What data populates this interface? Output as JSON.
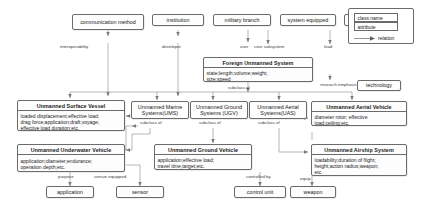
{
  "diagram": {
    "legend": {
      "class_name": "class name",
      "attribute": "attribute",
      "relation": "relation",
      "arrow_icon": "arrow-right-icon"
    },
    "nodes": {
      "communication_method": {
        "label": "communication method"
      },
      "institution": {
        "label": "institution"
      },
      "military_branch": {
        "label": "military branch"
      },
      "system_equipped": {
        "label": "system equipped"
      },
      "system_component": {
        "label": "system component"
      },
      "technology": {
        "label": "technology"
      },
      "foreign_unmanned_system": {
        "name": "Foreign Unmanned System",
        "attributes": "state;length;volume;weight;\nsize;speed"
      },
      "unmanned_surface_vessel": {
        "name": "Unmanned Surface Vessel",
        "attributes": "loaded displacement;effective load;\ndrag force;application;draft;voyage;\neffective load duration;etc."
      },
      "unmanned_marine_systems": {
        "label": "Unmanned Marine\nSystems(UMS)"
      },
      "unmanned_ground_systems": {
        "label": "Unmanned Ground\nSystems  (UGV)"
      },
      "unmanned_aerial_systems": {
        "label": "Unmanned Aerial\nSystems(UAS)"
      },
      "unmanned_aerial_vehicle": {
        "name": "Unmanned Aerial Vehicle",
        "attributes": "diameter rotor;   effective\nload;ceiling;etc."
      },
      "unmanned_underwater_vehicle": {
        "name": "Unmanned Underwater Vehicle",
        "attributes": "application;diameter;endurance;\noperation depth;etc."
      },
      "unmanned_ground_vehicle": {
        "name": "Unmanned Ground Vehicle",
        "attributes": "application;effective load;\ntravel time;target;etc."
      },
      "unmanned_airship_system": {
        "name": "Unmanned Airship System",
        "attributes": "loadability;duration of flight;\nheight;action radius;weapon;\netc."
      },
      "application": {
        "label": "application"
      },
      "sensor": {
        "label": "sensor"
      },
      "control_unit": {
        "label": "control unit"
      },
      "weapon": {
        "label": "weapon"
      }
    },
    "edge_labels": {
      "interoperability": "interoperability",
      "developer": "developer",
      "user": "user",
      "core_subsystem": "core subsystem",
      "load": "load",
      "research_emphasis": "research emphasis",
      "subclass_of_1": "subclass of",
      "subclass_of_2": "subclass of",
      "subclass_of_3": "subclass of",
      "subclass_of_4": "subclass of",
      "subclass_of_5": "subclass of",
      "subclass_of_6": "subclass of",
      "purpose": "purpose",
      "sensor_equipped": "sensor equipped",
      "controlled_by": "controlled by",
      "equip": "equip"
    },
    "colors": {
      "line": "#8a8a8a",
      "border": "#6b6b6b",
      "text": "#1a1a1a",
      "background": "#ffffff"
    }
  }
}
